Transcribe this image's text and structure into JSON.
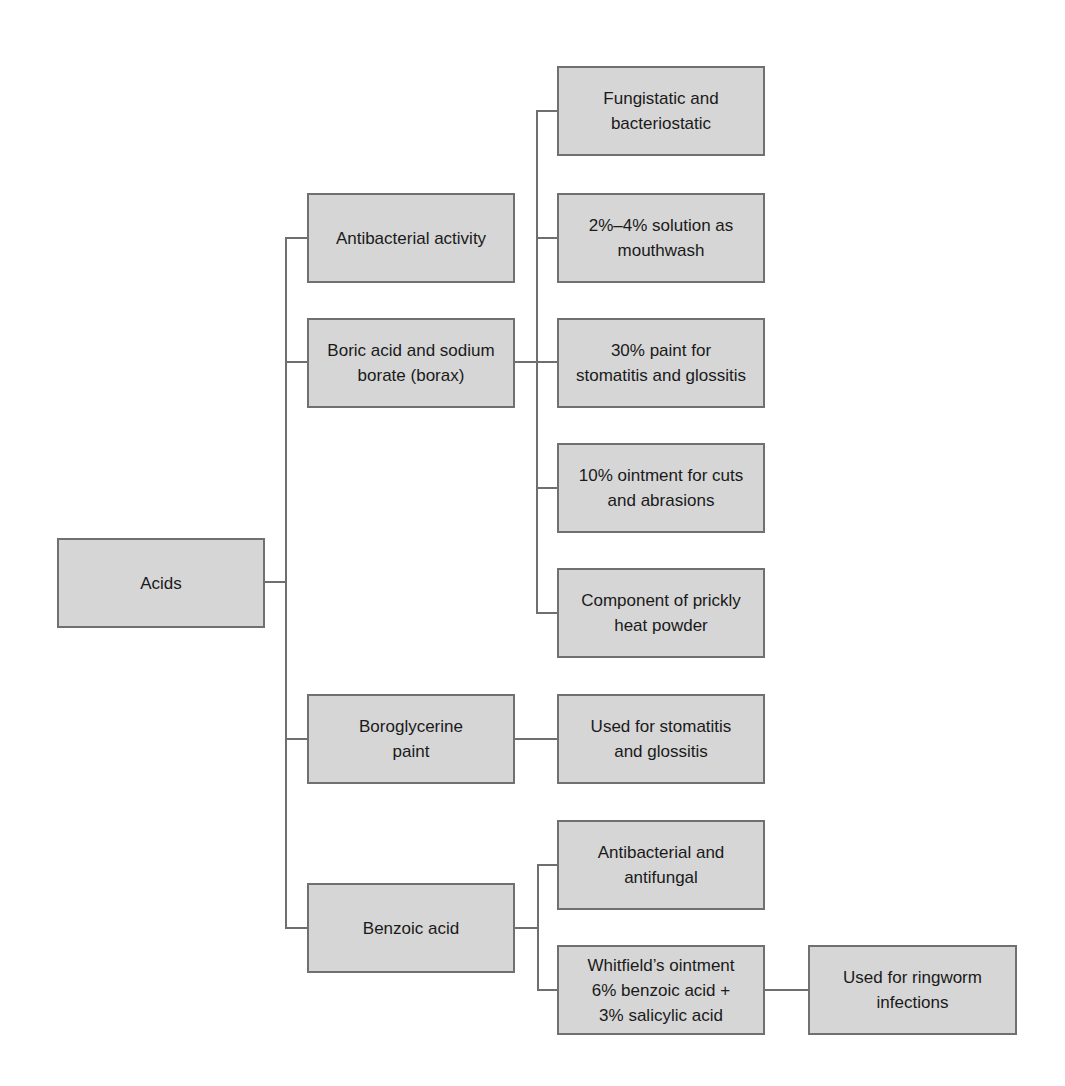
{
  "diagram": {
    "title": "",
    "root": {
      "label": "Acids"
    },
    "level1": [
      {
        "id": "antibacterial-activity",
        "label": "Antibacterial activity"
      },
      {
        "id": "boric-acid",
        "label": "Boric acid and sodium\nborate (borax)"
      },
      {
        "id": "boroglycerine",
        "label": "Boroglycerine\npaint"
      },
      {
        "id": "benzoic-acid",
        "label": "Benzoic acid"
      }
    ],
    "boric_children": [
      {
        "label": "Fungistatic and\nbacteriostatic"
      },
      {
        "label": "2%–4% solution as\nmouthwash"
      },
      {
        "label": "30% paint for\nstomatitis and glossitis"
      },
      {
        "label": "10% ointment for cuts\nand abrasions"
      },
      {
        "label": "Component of prickly\nheat powder"
      }
    ],
    "boroglycerine_children": [
      {
        "label": "Used for stomatitis\nand glossitis"
      }
    ],
    "benzoic_children": [
      {
        "label": "Antibacterial and\nantifungal"
      },
      {
        "label": "Whitfield’s ointment\n6% benzoic acid +\n3% salicylic acid"
      }
    ],
    "whitfield_children": [
      {
        "label": "Used for ringworm\ninfections"
      }
    ],
    "colors": {
      "box_fill": "#d6d6d6",
      "box_border": "#707070",
      "connector": "#6f6f6f",
      "text": "#1a1a1a",
      "background": "#ffffff"
    }
  }
}
